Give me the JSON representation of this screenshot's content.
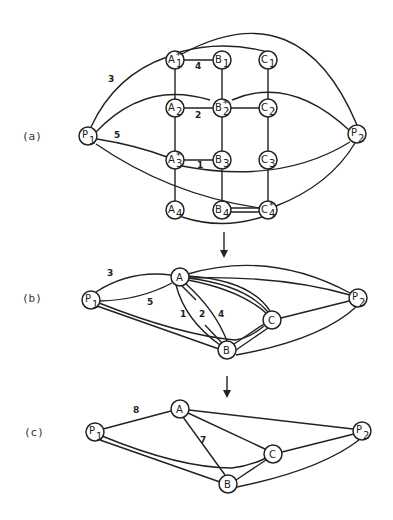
{
  "panels": {
    "a": {
      "label": "(a)",
      "nodes": {
        "P1": {
          "name": "P",
          "sub": "1",
          "star": ""
        },
        "P2": {
          "name": "P",
          "sub": "2",
          "star": ""
        },
        "A1": {
          "name": "A",
          "sub": "1",
          "star": "*"
        },
        "B1": {
          "name": "B",
          "sub": "1",
          "star": ""
        },
        "C1": {
          "name": "C",
          "sub": "1",
          "star": ""
        },
        "A2": {
          "name": "A",
          "sub": "2",
          "star": ""
        },
        "B2": {
          "name": "B",
          "sub": "2",
          "star": "*"
        },
        "C2": {
          "name": "C",
          "sub": "2",
          "star": ""
        },
        "A3": {
          "name": "A",
          "sub": "3",
          "star": "*"
        },
        "B3": {
          "name": "B",
          "sub": "3",
          "star": ""
        },
        "C3": {
          "name": "C",
          "sub": "3",
          "star": ""
        },
        "A4": {
          "name": "A",
          "sub": "4",
          "star": ""
        },
        "B4": {
          "name": "B",
          "sub": "4",
          "star": ""
        },
        "C4": {
          "name": "C",
          "sub": "4",
          "star": "*"
        }
      },
      "edge_labels": {
        "p1_a1": "3",
        "a1_b1": "4",
        "a2_b2": "2",
        "p1_a3": "5",
        "a3_b3": "1"
      }
    },
    "b": {
      "label": "(b)",
      "nodes": {
        "P1": {
          "name": "P",
          "sub": "1"
        },
        "P2": {
          "name": "P",
          "sub": "2"
        },
        "A": {
          "name": "A"
        },
        "B": {
          "name": "B"
        },
        "C": {
          "name": "C"
        }
      },
      "edge_labels": {
        "p1_a_top": "3",
        "p1_a_low": "5",
        "a_b_1": "1",
        "a_b_2": "2",
        "a_b_4": "4"
      }
    },
    "c": {
      "label": "(c)",
      "nodes": {
        "P1": {
          "name": "P",
          "sub": "1"
        },
        "P2": {
          "name": "P",
          "sub": "2"
        },
        "A": {
          "name": "A"
        },
        "B": {
          "name": "B"
        },
        "C": {
          "name": "C"
        }
      },
      "edge_labels": {
        "p1_a": "8",
        "a_b": "7"
      }
    }
  },
  "arrows": {
    "ab": "down-arrow",
    "bc": "down-arrow"
  }
}
